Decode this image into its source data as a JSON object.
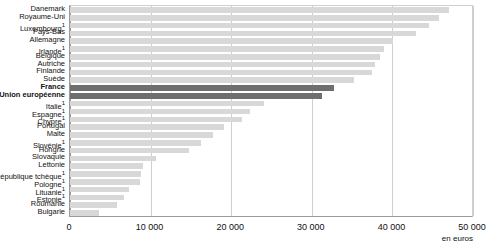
{
  "chart": {
    "title_clipped": "",
    "unit_label": "en euros"
  },
  "chart_data": {
    "type": "bar",
    "orientation": "horizontal",
    "title": "",
    "xlabel": "en euros",
    "ylabel": "",
    "xlim": [
      0,
      50000
    ],
    "xticks": [
      0,
      10000,
      20000,
      30000,
      40000,
      50000
    ],
    "xticklabels": [
      "0",
      "10 000",
      "20 000",
      "30 000",
      "40 000",
      "50 000"
    ],
    "grid": true,
    "legend": "none",
    "highlight_color": "#6e6e6e",
    "bar_color": "#d8d8d8",
    "highlighted_categories": [
      "France",
      "Union européenne"
    ],
    "categories": [
      "Danemark",
      "Royaume-Uni",
      "Luxembourg",
      "Pays-Bas",
      "Allemagne",
      "Irlande",
      "Belgique",
      "Autriche",
      "Finlande",
      "Suède",
      "France",
      "Union européenne",
      "Italie",
      "Espagne",
      "Chypre",
      "Portugal",
      "Malte",
      "Slovénie",
      "Hongrie",
      "Slovaquie",
      "Lettonie",
      "République tchèque",
      "Pologne",
      "Lituanie",
      "Estonie",
      "Roumanie",
      "Bulgarie"
    ],
    "footnote_markers": [
      "",
      "",
      "1",
      "",
      "",
      "1",
      "",
      "",
      "",
      "",
      "",
      "",
      "1",
      "1",
      "1",
      "",
      "",
      "1",
      "",
      "",
      "",
      "1",
      "1",
      "1",
      "1",
      "",
      ""
    ],
    "values": [
      47000,
      45800,
      44600,
      42900,
      40100,
      38900,
      38400,
      37900,
      37500,
      35200,
      32700,
      31300,
      24100,
      22300,
      21400,
      19100,
      17700,
      16300,
      14800,
      10700,
      9000,
      8800,
      8700,
      7300,
      6700,
      5800,
      3600
    ]
  }
}
